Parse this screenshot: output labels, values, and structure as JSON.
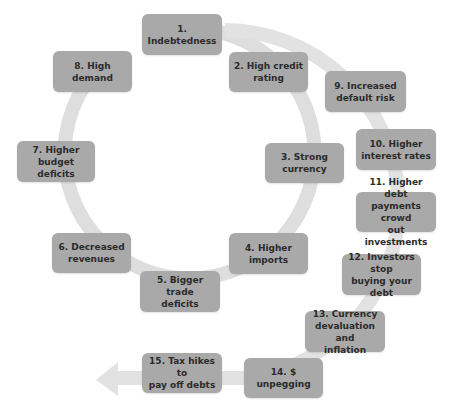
{
  "diagram": {
    "type": "cycle-flow",
    "colors": {
      "node_fill": "#a9a9a9",
      "node_text": "#2b2b2b",
      "arrow": "#dcdcdc",
      "background": "#ffffff"
    },
    "inner_cycle": [
      {
        "id": 1,
        "label": "1. Indebtedness"
      },
      {
        "id": 2,
        "label": "2. High credit\nrating"
      },
      {
        "id": 3,
        "label": "3. Strong\ncurrency"
      },
      {
        "id": 4,
        "label": "4. Higher\nimports"
      },
      {
        "id": 5,
        "label": "5. Bigger\ntrade\ndeficits"
      },
      {
        "id": 6,
        "label": "6. Decreased\nrevenues"
      },
      {
        "id": 7,
        "label": "7. Higher\nbudget\ndeficits"
      },
      {
        "id": 8,
        "label": "8. High\ndemand"
      }
    ],
    "outer_path": [
      {
        "id": 9,
        "label": "9. Increased\ndefault risk"
      },
      {
        "id": 10,
        "label": "10. Higher\ninterest rates"
      },
      {
        "id": 11,
        "label": "11. Higher debt\npayments crowd\nout investments"
      },
      {
        "id": 12,
        "label": "12. Investors stop\nbuying your debt"
      },
      {
        "id": 13,
        "label": "13. Currency\ndevaluation and\ninflation"
      },
      {
        "id": 14,
        "label": "14. $ unpegging"
      },
      {
        "id": 15,
        "label": "15. Tax hikes to\npay off debts"
      }
    ]
  }
}
